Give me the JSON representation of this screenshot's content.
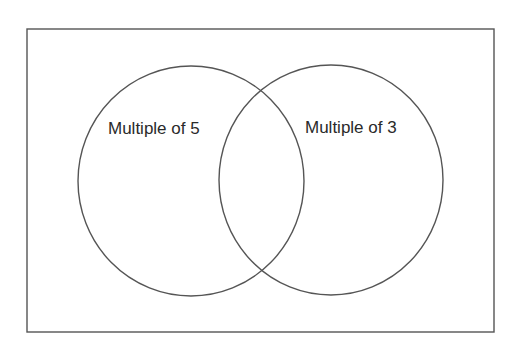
{
  "diagram": {
    "type": "venn",
    "frame": {
      "x": 27,
      "y": 29,
      "width": 467,
      "height": 303,
      "stroke": "#555555"
    },
    "sets": [
      {
        "id": "multiple-of-5",
        "label": "Multiple of 5",
        "shape": {
          "cx": 191,
          "cy": 181,
          "rx": 113,
          "ry": 115
        },
        "label_pos": {
          "x": 108,
          "y": 134
        },
        "stroke": "#555555"
      },
      {
        "id": "multiple-of-3",
        "label": "Multiple of 3",
        "shape": {
          "cx": 331,
          "cy": 180,
          "rx": 112,
          "ry": 115
        },
        "label_pos": {
          "x": 305,
          "y": 133
        },
        "stroke": "#555555"
      }
    ],
    "intersection_label": ""
  }
}
